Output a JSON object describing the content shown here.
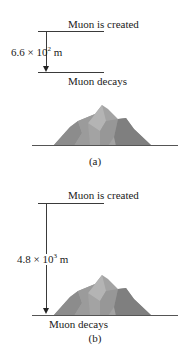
{
  "figure": {
    "panels": [
      {
        "id": "a",
        "top_label": "Muon is created",
        "bottom_label": "Muon decays",
        "distance_mantissa": "6.6 × 10",
        "distance_exponent": "2",
        "distance_unit": " m",
        "caption": "(a)"
      },
      {
        "id": "b",
        "top_label": "Muon is created",
        "bottom_label": "Muon decays",
        "distance_mantissa": "4.8 × 10",
        "distance_exponent": "3",
        "distance_unit": " m",
        "caption": "(b)"
      }
    ],
    "colors": {
      "line": "#3a3a3a",
      "mountain_light": "#a8a8a8",
      "mountain_mid": "#949494",
      "mountain_dark": "#7d7d7d"
    }
  }
}
